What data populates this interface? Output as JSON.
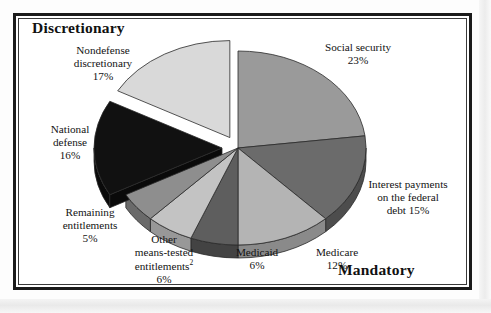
{
  "figure": {
    "section_titles": {
      "left": "Discretionary",
      "right": "Mandatory"
    }
  },
  "chart_data": {
    "type": "pie",
    "title": "",
    "subtitle": "",
    "xlabel": "",
    "ylabel": "",
    "legend_position": "none",
    "grid": false,
    "three_d": true,
    "categories": [
      "Social security",
      "Interest payments on the federal debt",
      "Medicare",
      "Medicaid",
      "Other means-tested entitlements",
      "Remaining entitlements",
      "National defense",
      "Nondefense discretionary"
    ],
    "values": [
      23,
      15,
      12,
      6,
      6,
      5,
      16,
      17
    ],
    "units": "percent",
    "slices": [
      {
        "name": "Social security",
        "label_lines": [
          "Social security",
          "23%"
        ],
        "value": 23,
        "color": "#9a9a9a",
        "side_color": "#6f6f6f",
        "exploded": false,
        "group": "Mandatory"
      },
      {
        "name": "Interest payments on the federal debt",
        "label_lines": [
          "Interest payments",
          "on the federal",
          "debt 15%"
        ],
        "value": 15,
        "color": "#6b6b6b",
        "side_color": "#4d4d4d",
        "exploded": false,
        "group": "Mandatory"
      },
      {
        "name": "Medicare",
        "label_lines": [
          "Medicare",
          "12%"
        ],
        "value": 12,
        "color": "#b4b4b4",
        "side_color": "#8a8a8a",
        "exploded": false,
        "group": "Mandatory"
      },
      {
        "name": "Medicaid",
        "label_lines": [
          "Medicaid",
          "6%"
        ],
        "value": 6,
        "color": "#5e5e5e",
        "side_color": "#434343",
        "exploded": false,
        "group": "Mandatory"
      },
      {
        "name": "Other means-tested entitlements",
        "label_lines": [
          "Other",
          "means-tested",
          "entitlements",
          "6%"
        ],
        "label_superscript": "2",
        "value": 6,
        "color": "#c3c3c3",
        "side_color": "#989898",
        "exploded": false,
        "group": "Mandatory"
      },
      {
        "name": "Remaining entitlements",
        "label_lines": [
          "Remaining",
          "entitlements",
          "5%"
        ],
        "value": 5,
        "color": "#8e8e8e",
        "side_color": "#6a6a6a",
        "exploded": false,
        "group": "Mandatory"
      },
      {
        "name": "National defense",
        "label_lines": [
          "National",
          "defense",
          "16%"
        ],
        "value": 16,
        "color": "#111111",
        "side_color": "#0a0a0a",
        "exploded": true,
        "group": "Discretionary"
      },
      {
        "name": "Nondefense discretionary",
        "label_lines": [
          "Nondefense",
          "discretionary",
          "17%"
        ],
        "value": 17,
        "color": "#d9d9d9",
        "side_color": "#b0b0b0",
        "exploded": true,
        "group": "Discretionary"
      }
    ],
    "total": 100
  }
}
